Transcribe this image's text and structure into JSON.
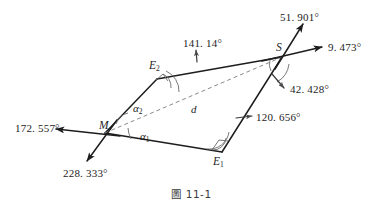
{
  "figure": {
    "caption": "圖 11-1",
    "points": [
      {
        "id": "S",
        "label": "S",
        "sub": "",
        "x": 282,
        "y": 57
      },
      {
        "id": "E2",
        "label": "E",
        "sub": "2",
        "x": 157,
        "y": 79
      },
      {
        "id": "M",
        "label": "M",
        "sub": "",
        "x": 105,
        "y": 133
      },
      {
        "id": "E1",
        "label": "E",
        "sub": "1",
        "x": 222,
        "y": 152
      }
    ],
    "point_labels": [
      {
        "name": "point-label-S",
        "text": "S",
        "sub": "",
        "left": 276,
        "top": 42
      },
      {
        "name": "point-label-E2",
        "text": "E",
        "sub": "2",
        "left": 149,
        "top": 60
      },
      {
        "name": "point-label-M",
        "text": "M",
        "sub": "",
        "left": 99,
        "top": 120
      },
      {
        "name": "point-label-E1",
        "text": "E",
        "sub": "1",
        "left": 213,
        "top": 156
      }
    ],
    "angle_labels": [
      {
        "name": "bearing-label-51901",
        "text": "51. 901°",
        "left": 280,
        "top": 12
      },
      {
        "name": "bearing-label-9473",
        "text": "9. 473°",
        "left": 328,
        "top": 42
      },
      {
        "name": "bearing-label-14114",
        "text": "141. 14°",
        "left": 183,
        "top": 38
      },
      {
        "name": "bearing-label-42428",
        "text": "42. 428°",
        "left": 286,
        "top": 84
      },
      {
        "name": "bearing-label-120656",
        "text": "120. 656°",
        "left": 253,
        "top": 112
      },
      {
        "name": "bearing-label-172557",
        "text": "172. 557°",
        "left": 15,
        "top": 123
      },
      {
        "name": "bearing-label-228333",
        "text": "228. 333°",
        "left": 63,
        "top": 168
      }
    ],
    "greek_labels": [
      {
        "name": "angle-label-alpha2",
        "text": "α",
        "sub": "2",
        "left": 133,
        "top": 103
      },
      {
        "name": "angle-label-alpha1",
        "text": "α",
        "sub": "1",
        "left": 140,
        "top": 131
      }
    ],
    "distance_labels": [
      {
        "name": "distance-label-d",
        "text": "d",
        "left": 191,
        "top": 104
      }
    ],
    "colors": {
      "stroke": "#1d1d1d",
      "arc": "#6a6a6a",
      "dashed": "#8a8a8a",
      "background": "#ffffff"
    },
    "angle_values": {
      "bearing_S_up": "51.901",
      "bearing_S_right": "9.473",
      "bearing_E2": "141.14",
      "bearing_S_down": "42.428",
      "bearing_E1": "120.656",
      "bearing_M_left": "172.557",
      "bearing_M_down": "228.333"
    }
  }
}
